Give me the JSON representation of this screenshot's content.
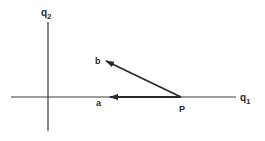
{
  "diagram": {
    "colors": {
      "ink": "#2a2a2a",
      "background": "#ffffff"
    },
    "axes": {
      "horizontal": {
        "label_main": "q",
        "label_sub": "1",
        "x1": 11,
        "x2": 236,
        "y": 97
      },
      "vertical": {
        "label_main": "q",
        "label_sub": "2",
        "x": 48,
        "y1": 22,
        "y2": 131
      }
    },
    "point": {
      "label": "P",
      "x": 181,
      "y": 97
    },
    "vectors": [
      {
        "id": "a",
        "label": "a",
        "from": [
          181,
          97
        ],
        "to": [
          110,
          97
        ],
        "label_pos": [
          97,
          106
        ]
      },
      {
        "id": "b",
        "label": "b",
        "from": [
          181,
          97
        ],
        "to": [
          106,
          61
        ],
        "label_pos": [
          95,
          64
        ]
      }
    ]
  }
}
